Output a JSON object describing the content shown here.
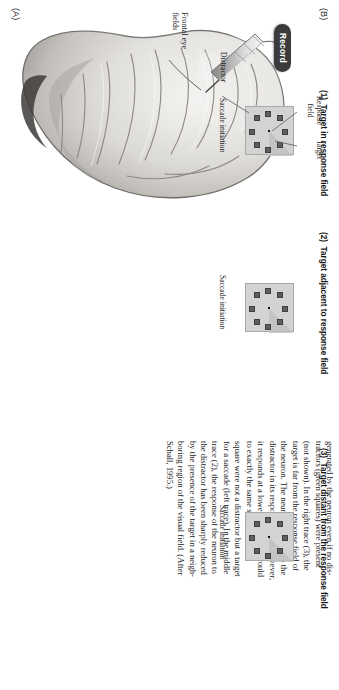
{
  "figure": {
    "panel_a_letter": "(A)",
    "panel_b_letter": "(B)"
  },
  "panel_a": {
    "record_label": "Record",
    "brain_region_label": "Frontal eye\nfields"
  },
  "panel_b": {
    "subpanels": [
      {
        "number": "(1)",
        "title": "(1)  Target in response field",
        "saccade_label": "Saccade initiation",
        "annotations": [
          {
            "name": "response-field",
            "text": "Response\nfield"
          },
          {
            "name": "target",
            "text": "Target"
          },
          {
            "name": "distractor",
            "text": "Distractor"
          }
        ]
      },
      {
        "number": "(2)",
        "title": "(2)  Target adjacent to response field",
        "saccade_label": "Saccade initiation",
        "annotations": []
      },
      {
        "number": "(3)",
        "title": "(3)  Target distant from the response field",
        "saccade_label": "Saccade initiation",
        "annotations": []
      }
    ],
    "stimulus": {
      "square_count": 8,
      "fixation_point": "center-dot",
      "square_color": "#5e5e5e",
      "field_color": "#d3d3d3",
      "response_field_color": "#c0c0c0"
    }
  },
  "caption": {
    "lines": [
      "generated by the neuron even if no dis-",
      "tractors (green squares) were present",
      "(not shown). In the right trace (3), the",
      "target is far from the response field of",
      "the neuron. The neuron responds to the",
      "distractor in its response field. However,",
      "it responds at a lower rate than it would",
      "to exactly the same stimulus if the",
      "square were not a distractor but a target",
      "for a saccade (left trace). In the middle",
      "trace (2), the response of the neuron to",
      "the distractor has been sharply reduced",
      "by the presence of the target in a neigh-",
      "boring region of the visual field. (After",
      "Schall, 1995.)"
    ]
  }
}
